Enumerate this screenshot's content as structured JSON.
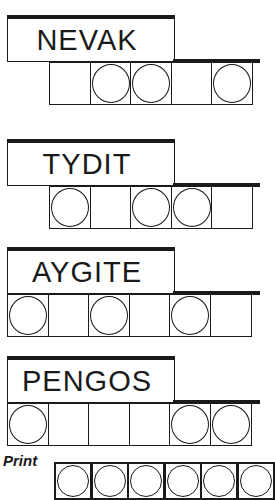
{
  "game": "Jumble word puzzle",
  "puzzles": [
    {
      "scrambled": "NEVAK",
      "letters": 5,
      "circles": [
        false,
        true,
        true,
        false,
        true
      ]
    },
    {
      "scrambled": "TYDIT",
      "letters": 5,
      "circles": [
        true,
        false,
        true,
        true,
        false
      ]
    },
    {
      "scrambled": "AYGITE",
      "letters": 6,
      "circles": [
        true,
        false,
        true,
        false,
        true,
        false
      ]
    },
    {
      "scrambled": "PENGOS",
      "letters": 6,
      "circles": [
        true,
        false,
        false,
        false,
        true,
        true
      ]
    }
  ],
  "answer": {
    "label": "Print",
    "visible_cells": 6
  },
  "colors": {
    "ink": "#1a1a1a",
    "paper": "#ffffff"
  }
}
